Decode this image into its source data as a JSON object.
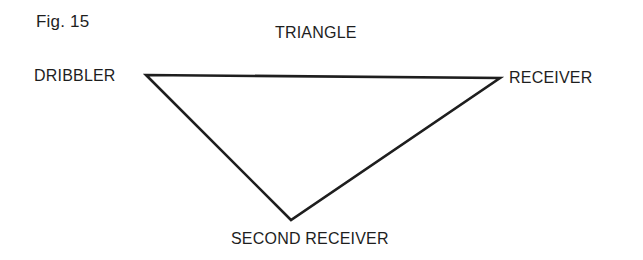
{
  "figure": {
    "label": "Fig. 15",
    "title": "TRIANGLE"
  },
  "nodes": [
    {
      "id": "dribbler",
      "label": "DRIBBLER"
    },
    {
      "id": "receiver",
      "label": "RECEIVER"
    },
    {
      "id": "second_receiver",
      "label": "SECOND RECEIVER"
    }
  ],
  "edges": [
    {
      "from": "dribbler",
      "to": "receiver"
    },
    {
      "from": "receiver",
      "to": "second_receiver"
    },
    {
      "from": "second_receiver",
      "to": "dribbler"
    }
  ],
  "colors": {
    "line": "#1e1e1e",
    "background": "#ffffff"
  }
}
